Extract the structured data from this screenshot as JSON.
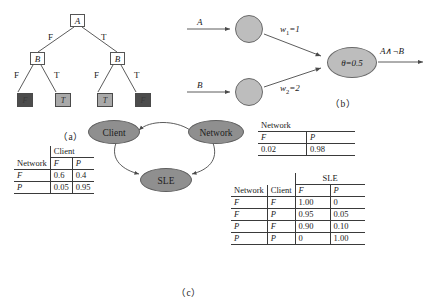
{
  "figure_a": {
    "caption": "（a）",
    "root": {
      "label": "A"
    },
    "root_edges": [
      {
        "label": "F"
      },
      {
        "label": "T"
      }
    ],
    "internal": [
      {
        "label": "B"
      },
      {
        "label": "B"
      }
    ],
    "left_edges": [
      {
        "label": "F"
      },
      {
        "label": "T"
      }
    ],
    "right_edges": [
      {
        "label": "F"
      },
      {
        "label": "T"
      }
    ],
    "leaves": [
      {
        "label": "F",
        "shade": "dark"
      },
      {
        "label": "T",
        "shade": "light"
      },
      {
        "label": "T",
        "shade": "light"
      },
      {
        "label": "F",
        "shade": "dark"
      }
    ]
  },
  "figure_b": {
    "caption": "（b）",
    "inputs": [
      {
        "label": "A"
      },
      {
        "label": "B"
      }
    ],
    "weights": [
      {
        "name": "w",
        "sub": "1",
        "value": "=1"
      },
      {
        "name": "w",
        "sub": "2",
        "value": "=2"
      }
    ],
    "threshold": "θ=0.5",
    "output": "A∧¬B"
  },
  "figure_c": {
    "caption": "（c）",
    "nodes": [
      {
        "id": "client",
        "label": "Client"
      },
      {
        "id": "network",
        "label": "Network"
      },
      {
        "id": "sle",
        "label": "SLE"
      }
    ],
    "edges": [
      {
        "from": "network",
        "to": "client"
      },
      {
        "from": "client",
        "to": "sle"
      },
      {
        "from": "network",
        "to": "sle"
      }
    ],
    "client_table": {
      "group_header": "Client",
      "parent_header": "Network",
      "columns": [
        "F",
        "P"
      ],
      "rows": [
        {
          "parent": "F",
          "values": [
            "0.6",
            "0.4"
          ]
        },
        {
          "parent": "P",
          "values": [
            "0.05",
            "0.95"
          ]
        }
      ]
    },
    "network_table": {
      "group_header": "Network",
      "columns": [
        "F",
        "P"
      ],
      "rows": [
        {
          "values": [
            "0.02",
            "0.98"
          ]
        }
      ]
    },
    "sle_table": {
      "group_header": "SLE",
      "parent_headers": [
        "Network",
        "Client"
      ],
      "columns": [
        "F",
        "P"
      ],
      "rows": [
        {
          "parents": [
            "F",
            "F"
          ],
          "values": [
            "1.00",
            "0"
          ]
        },
        {
          "parents": [
            "F",
            "P"
          ],
          "values": [
            "0.95",
            "0.05"
          ]
        },
        {
          "parents": [
            "P",
            "F"
          ],
          "values": [
            "0.90",
            "0.10"
          ]
        },
        {
          "parents": [
            "P",
            "P"
          ],
          "values": [
            "0",
            "1.00"
          ]
        }
      ]
    }
  },
  "colors": {
    "node_fill": "#8f8f8f",
    "circle_fill": "#bdbdbd",
    "leaf_dark": "#4c4c4c",
    "leaf_light": "#a9a9a9",
    "line": "#4a4a4a"
  }
}
